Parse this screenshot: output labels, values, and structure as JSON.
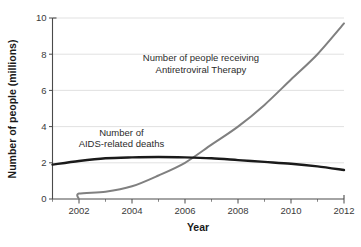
{
  "chart_data": {
    "type": "line",
    "title": "",
    "xlabel": "Year",
    "ylabel": "Number of people (millions)",
    "xlim": [
      2001,
      2012
    ],
    "ylim": [
      0,
      10
    ],
    "grid": "horizontal",
    "legend_position": "inline-annotations",
    "x_tick_labels": [
      "2002",
      "2004",
      "2006",
      "2008",
      "2010",
      "2012"
    ],
    "x_tick_values": [
      2002,
      2004,
      2006,
      2008,
      2010,
      2012
    ],
    "x_minor_ticks": [
      2001,
      2003,
      2005,
      2007,
      2009,
      2011
    ],
    "y_tick_labels": [
      "0",
      "2",
      "4",
      "6",
      "8",
      "10"
    ],
    "y_tick_values": [
      0,
      2,
      4,
      6,
      8,
      10
    ],
    "series": [
      {
        "name": "Number of people receiving Antiretroviral Therapy",
        "color": "#808080",
        "width": 2.0,
        "x": [
          2002,
          2002,
          2003,
          2004,
          2005,
          2006,
          2007,
          2008,
          2009,
          2010,
          2011,
          2012
        ],
        "values": [
          0.0,
          0.3,
          0.4,
          0.7,
          1.3,
          2.0,
          3.0,
          4.0,
          5.2,
          6.6,
          8.0,
          9.7
        ]
      },
      {
        "name": "Number of AIDS-related deaths",
        "color": "#1a1a1a",
        "width": 2.4,
        "x": [
          2001,
          2002,
          2003,
          2004,
          2005,
          2006,
          2007,
          2008,
          2009,
          2010,
          2011,
          2012
        ],
        "values": [
          1.9,
          2.1,
          2.25,
          2.3,
          2.32,
          2.3,
          2.25,
          2.15,
          2.05,
          1.95,
          1.8,
          1.6
        ]
      }
    ],
    "annotations": [
      {
        "id": "art-annotation",
        "lines": [
          "Number of people receiving",
          "Antiretroviral Therapy"
        ],
        "x": 2006.6,
        "y": 7.6,
        "align": "middle"
      },
      {
        "id": "deaths-annotation",
        "lines": [
          "Number of",
          "AIDS-related deaths"
        ],
        "x": 2003.6,
        "y": 3.5,
        "align": "middle"
      }
    ]
  }
}
